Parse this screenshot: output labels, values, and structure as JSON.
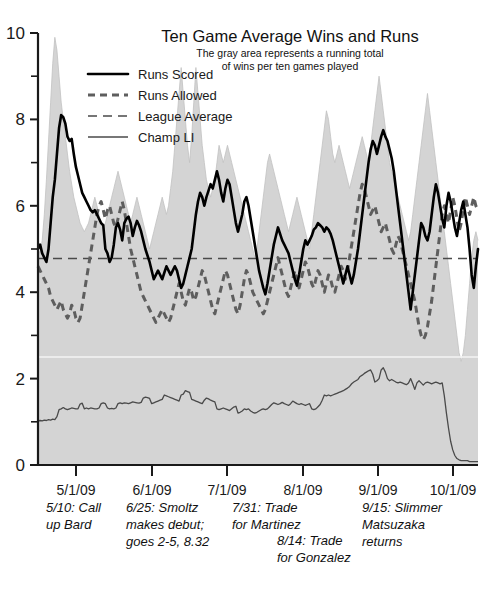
{
  "chart_data": {
    "type": "line",
    "title": "Ten Game Average Wins and Runs",
    "subtitle_line1": "The gray area represents a running total",
    "subtitle_line2": "of wins per ten games played",
    "xlabel": "",
    "ylabel": "",
    "ylim": [
      0,
      10
    ],
    "grid": false,
    "legend_position": "top-center",
    "y_ticks_major": [
      0,
      2,
      4,
      6,
      8,
      10
    ],
    "y_ticks_minor": [
      1,
      3,
      5,
      7,
      9
    ],
    "x_tick_labels": [
      "5/1/09",
      "6/1/09",
      "7/1/09",
      "8/1/09",
      "9/1/09",
      "10/1/09"
    ],
    "x_tick_positions": [
      76,
      152,
      227,
      303,
      378,
      453
    ],
    "legend": [
      {
        "label": "Runs Scored",
        "style": "solid-thick-black",
        "color": "#000000"
      },
      {
        "label": "Runs Allowed",
        "style": "dashed-thick-gray",
        "color": "#5e5e5e"
      },
      {
        "label": "League Average",
        "style": "dashed-thin-gray",
        "color": "#4a4a4a"
      },
      {
        "label": "Champ LI",
        "style": "solid-thin-gray",
        "color": "#4a4a4a"
      }
    ],
    "annotations": [
      {
        "id": "call-up-bard",
        "text_lines": [
          "5/10: Call",
          "up Bard"
        ],
        "x": 46,
        "y": 512
      },
      {
        "id": "smoltz-debut",
        "text_lines": [
          "6/25: Smoltz",
          "makes debut;",
          "goes 2-5, 8.32"
        ],
        "x": 126,
        "y": 512
      },
      {
        "id": "trade-for-martinez",
        "text_lines": [
          "7/31: Trade",
          "for Martinez"
        ],
        "x": 232,
        "y": 512
      },
      {
        "id": "trade-for-gonzalez",
        "text_lines": [
          "8/14: Trade",
          "for Gonzalez"
        ],
        "x": 277,
        "y": 545
      },
      {
        "id": "matsuzaka-returns",
        "text_lines": [
          "9/15: Slimmer",
          "Matsuzaka",
          "returns"
        ],
        "x": 362,
        "y": 512
      }
    ],
    "league_average_value": 4.78,
    "white_guide_value": 2.5,
    "series": [
      {
        "name": "Champ LI",
        "values": [
          1.02,
          1.03,
          1.02,
          1.04,
          1.03,
          1.05,
          1.04,
          1.06,
          1.05,
          1.12,
          1.28,
          1.3,
          1.33,
          1.3,
          1.28,
          1.3,
          1.32,
          1.31,
          1.3,
          1.3,
          1.41,
          1.43,
          1.3,
          1.32,
          1.3,
          1.32,
          1.31,
          1.3,
          1.3,
          1.32,
          1.42,
          1.44,
          1.42,
          1.32,
          1.3,
          1.31,
          1.3,
          1.32,
          1.42,
          1.44,
          1.42,
          1.44,
          1.43,
          1.42,
          1.44,
          1.46,
          1.45,
          1.44,
          1.43,
          1.45,
          1.55,
          1.57,
          1.56,
          1.54,
          1.42,
          1.44,
          1.46,
          1.48,
          1.5,
          1.52,
          1.62,
          1.6,
          1.58,
          1.56,
          1.54,
          1.52,
          1.5,
          1.48,
          1.62,
          1.64,
          1.72,
          1.7,
          1.68,
          1.52,
          1.5,
          1.48,
          1.46,
          1.44,
          1.42,
          1.5,
          1.55,
          1.53,
          1.5,
          1.48,
          1.46,
          1.3,
          1.28,
          1.3,
          1.32,
          1.3,
          1.28,
          1.26,
          1.3,
          1.34,
          1.36,
          1.2,
          1.22,
          1.25,
          1.3,
          1.28,
          1.3,
          1.25,
          1.22,
          1.2,
          1.22,
          1.25,
          1.28,
          1.3,
          1.28,
          1.3,
          1.35,
          1.4,
          1.44,
          1.42,
          1.4,
          1.42,
          1.45,
          1.42,
          1.4,
          1.38,
          1.42,
          1.48,
          1.45,
          1.42,
          1.4,
          1.42,
          1.4,
          1.38,
          1.4,
          1.42,
          1.3,
          1.28,
          1.3,
          1.35,
          1.4,
          1.5,
          1.62,
          1.6,
          1.62,
          1.6,
          1.62,
          1.64,
          1.66,
          1.68,
          1.7,
          1.72,
          1.75,
          1.78,
          1.82,
          1.88,
          1.92,
          1.95,
          1.98,
          2.05,
          2.08,
          2.12,
          2.15,
          2.18,
          2.2,
          2.1,
          1.92,
          1.95,
          2.0,
          2.2,
          2.25,
          2.15,
          2.0,
          1.95,
          1.98,
          1.95,
          1.92,
          1.9,
          1.92,
          1.9,
          1.88,
          1.86,
          1.9,
          2.0,
          1.88,
          1.75,
          1.9,
          1.95,
          1.9,
          1.85,
          1.9,
          1.92,
          1.9,
          1.88,
          1.9,
          1.92,
          1.9,
          1.88,
          1.9,
          1.6,
          1.2,
          0.85,
          0.55,
          0.35,
          0.22,
          0.15,
          0.12,
          0.1,
          0.1,
          0.1,
          0.1,
          0.08,
          0.08,
          0.08,
          0.08,
          0.08
        ]
      },
      {
        "name": "Runs Scored",
        "values": [
          5.0,
          5.1,
          4.9,
          4.8,
          4.7,
          5.0,
          5.6,
          6.2,
          6.6,
          7.2,
          7.8,
          8.1,
          8.05,
          7.9,
          7.6,
          7.5,
          7.55,
          7.2,
          6.9,
          6.7,
          6.5,
          6.3,
          6.2,
          6.1,
          6.0,
          5.9,
          5.85,
          5.9,
          5.8,
          5.7,
          5.6,
          5.55,
          5.0,
          4.9,
          4.7,
          4.8,
          5.1,
          5.5,
          5.6,
          5.45,
          5.2,
          5.6,
          5.7,
          5.75,
          5.6,
          5.3,
          5.5,
          5.65,
          5.55,
          5.4,
          5.2,
          5.0,
          4.85,
          4.7,
          4.5,
          4.3,
          4.4,
          4.5,
          4.4,
          4.3,
          4.45,
          4.6,
          4.5,
          4.4,
          4.5,
          4.6,
          4.5,
          4.3,
          4.1,
          4.2,
          4.4,
          4.6,
          4.8,
          5.0,
          5.4,
          5.8,
          6.1,
          6.3,
          6.2,
          6.0,
          6.2,
          6.35,
          6.5,
          6.4,
          6.6,
          6.8,
          6.6,
          6.3,
          6.1,
          6.4,
          6.6,
          6.5,
          6.2,
          5.9,
          5.6,
          5.4,
          5.6,
          5.8,
          6.1,
          6.2,
          6.0,
          5.7,
          5.4,
          5.1,
          4.8,
          4.5,
          4.3,
          4.1,
          3.95,
          4.2,
          4.5,
          4.8,
          5.1,
          5.3,
          5.5,
          5.35,
          5.2,
          5.1,
          5.0,
          4.9,
          4.7,
          4.5,
          4.3,
          4.15,
          4.4,
          4.7,
          5.0,
          5.2,
          5.1,
          5.2,
          5.3,
          5.45,
          5.5,
          5.6,
          5.55,
          5.5,
          5.4,
          5.5,
          5.45,
          5.35,
          5.2,
          5.0,
          4.8,
          4.6,
          4.4,
          4.2,
          4.4,
          4.6,
          4.4,
          4.2,
          4.4,
          4.7,
          5.0,
          5.4,
          5.8,
          6.2,
          6.6,
          7.0,
          7.3,
          7.5,
          7.4,
          7.2,
          7.4,
          7.6,
          7.75,
          7.6,
          7.5,
          7.3,
          7.1,
          6.8,
          6.4,
          6.0,
          5.6,
          5.2,
          4.8,
          4.4,
          4.0,
          3.6,
          4.0,
          4.4,
          4.8,
          5.2,
          5.6,
          5.5,
          5.3,
          5.2,
          5.4,
          5.8,
          6.2,
          6.5,
          6.3,
          6.0,
          5.7,
          5.5,
          6.0,
          6.3,
          6.1,
          5.8,
          5.5,
          5.3,
          5.6,
          5.9,
          6.1,
          5.8,
          5.5,
          5.0,
          4.4,
          4.1,
          4.6,
          5.0
        ]
      },
      {
        "name": "Runs Allowed",
        "values": [
          4.6,
          4.5,
          4.4,
          4.3,
          4.2,
          4.1,
          3.9,
          3.8,
          3.7,
          3.6,
          3.7,
          3.8,
          3.6,
          3.5,
          3.4,
          3.5,
          3.7,
          3.6,
          3.4,
          3.3,
          3.4,
          3.7,
          4.0,
          4.3,
          4.6,
          4.9,
          5.2,
          5.5,
          5.8,
          6.0,
          6.1,
          5.9,
          5.7,
          5.9,
          6.0,
          5.8,
          5.6,
          5.5,
          5.7,
          5.9,
          6.1,
          5.9,
          5.6,
          5.3,
          5.0,
          4.8,
          4.6,
          4.4,
          4.2,
          4.0,
          3.9,
          3.8,
          3.7,
          3.6,
          3.5,
          3.4,
          3.3,
          3.4,
          3.5,
          3.6,
          3.5,
          3.4,
          3.3,
          3.4,
          3.6,
          3.8,
          4.0,
          4.2,
          4.0,
          3.8,
          3.7,
          3.9,
          4.1,
          4.0,
          3.8,
          3.9,
          4.1,
          4.3,
          4.5,
          4.4,
          4.2,
          4.0,
          3.8,
          3.6,
          3.5,
          3.7,
          3.9,
          4.1,
          4.3,
          4.5,
          4.4,
          4.2,
          4.0,
          3.8,
          3.6,
          3.5,
          3.7,
          4.0,
          4.3,
          4.5,
          4.4,
          4.2,
          4.0,
          3.9,
          3.8,
          3.7,
          3.6,
          3.5,
          3.6,
          3.8,
          4.0,
          4.2,
          4.4,
          4.6,
          4.8,
          4.6,
          4.4,
          4.2,
          4.0,
          3.9,
          4.1,
          4.3,
          4.5,
          4.3,
          4.1,
          4.3,
          4.5,
          4.7,
          4.6,
          4.4,
          4.2,
          4.1,
          4.3,
          4.5,
          4.4,
          4.2,
          4.0,
          4.2,
          4.4,
          4.3,
          4.1,
          4.0,
          4.2,
          4.4,
          4.6,
          4.5,
          4.3,
          4.5,
          4.8,
          5.1,
          5.4,
          5.7,
          6.0,
          6.3,
          6.5,
          6.4,
          6.2,
          6.0,
          5.8,
          5.9,
          6.0,
          5.8,
          5.6,
          5.4,
          5.5,
          5.6,
          5.4,
          5.2,
          5.0,
          4.9,
          5.1,
          5.3,
          5.2,
          5.0,
          4.8,
          4.6,
          4.4,
          4.2,
          4.0,
          3.8,
          3.5,
          3.2,
          3.0,
          2.9,
          3.0,
          3.2,
          3.5,
          3.8,
          4.2,
          4.6,
          5.0,
          5.4,
          5.8,
          6.0,
          5.8,
          5.6,
          5.9,
          6.2,
          6.0,
          5.7,
          5.4,
          5.6,
          5.9,
          6.2,
          6.0,
          5.8,
          6.0,
          6.2,
          6.0,
          5.9
        ]
      },
      {
        "name": "Wins per ten games (gray area)",
        "values": [
          5.0,
          4.9,
          5.2,
          5.8,
          6.6,
          7.5,
          8.4,
          9.3,
          9.9,
          9.6,
          9.0,
          8.4,
          8.0,
          7.6,
          7.2,
          6.8,
          6.5,
          6.2,
          6.0,
          5.8,
          5.6,
          5.5,
          5.4,
          5.5,
          5.6,
          5.8,
          6.0,
          6.2,
          6.0,
          5.8,
          5.6,
          5.5,
          5.6,
          5.8,
          6.0,
          6.2,
          6.4,
          6.6,
          6.8,
          6.6,
          6.4,
          6.2,
          6.0,
          5.8,
          5.6,
          5.8,
          6.0,
          6.2,
          6.0,
          5.8,
          5.6,
          5.4,
          5.2,
          5.0,
          5.2,
          5.4,
          5.6,
          5.8,
          6.0,
          6.2,
          6.0,
          5.8,
          6.0,
          6.4,
          6.8,
          7.4,
          8.0,
          8.6,
          9.2,
          8.6,
          8.0,
          7.4,
          7.0,
          7.6,
          8.4,
          9.2,
          8.6,
          8.0,
          7.4,
          7.0,
          6.6,
          6.4,
          6.2,
          6.4,
          6.6,
          7.0,
          7.4,
          7.2,
          7.0,
          7.2,
          7.4,
          7.2,
          7.0,
          6.8,
          6.6,
          6.4,
          6.2,
          6.0,
          5.8,
          5.6,
          5.4,
          5.2,
          5.0,
          4.8,
          5.0,
          5.4,
          5.8,
          6.2,
          6.6,
          7.0,
          7.2,
          7.0,
          6.8,
          6.6,
          6.4,
          6.2,
          6.0,
          5.8,
          5.6,
          5.4,
          5.6,
          5.8,
          6.0,
          6.2,
          6.0,
          5.8,
          5.6,
          5.4,
          5.2,
          5.0,
          5.4,
          5.8,
          6.2,
          6.6,
          7.0,
          7.4,
          7.8,
          8.2,
          8.0,
          7.6,
          7.2,
          7.0,
          7.2,
          7.4,
          7.2,
          7.0,
          6.8,
          6.6,
          6.4,
          6.6,
          6.8,
          7.0,
          7.2,
          7.4,
          7.6,
          7.4,
          7.2,
          7.0,
          7.4,
          7.8,
          8.2,
          8.6,
          9.0,
          8.6,
          8.2,
          7.8,
          7.4,
          7.0,
          6.8,
          6.6,
          6.4,
          6.2,
          6.0,
          5.8,
          5.6,
          5.4,
          5.2,
          5.4,
          5.8,
          6.2,
          6.6,
          7.0,
          7.4,
          7.8,
          8.2,
          8.6,
          8.2,
          7.8,
          7.4,
          7.0,
          6.6,
          6.2,
          5.8,
          5.4,
          5.0,
          4.6,
          4.2,
          3.8,
          3.4,
          3.0,
          2.6,
          2.4,
          2.6,
          3.0,
          3.6,
          4.2,
          4.8,
          5.2,
          5.4,
          5.2
        ]
      }
    ]
  },
  "colors": {
    "runs_scored": "#000000",
    "runs_allowed": "#5e5e5e",
    "league_average": "#4a4a4a",
    "champ_li": "#4a4a4a",
    "area_fill": "#d4d4d4",
    "axis": "#1a1a1a",
    "background": "#ffffff"
  }
}
